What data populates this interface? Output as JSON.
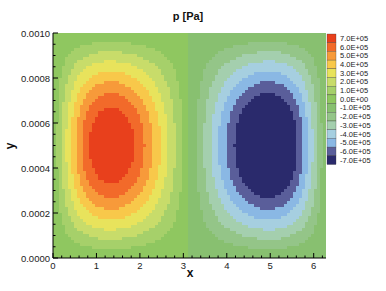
{
  "chart_data": {
    "type": "heatmap",
    "subtype": "filled-contour",
    "title": "p [Pa]",
    "xlabel": "x",
    "ylabel": "y",
    "xlim": [
      0,
      6.2832
    ],
    "ylim": [
      0,
      0.001
    ],
    "xticks": [
      0,
      1,
      2,
      3,
      4,
      5,
      6
    ],
    "xtick_labels": [
      "0",
      "1",
      "2",
      "3",
      "4",
      "5",
      "6"
    ],
    "yticks": [
      0,
      0.0002,
      0.0004,
      0.0006,
      0.0008,
      0.001
    ],
    "ytick_labels": [
      "0.0000",
      "0.0002",
      "0.0004",
      "0.0006",
      "0.0008",
      "0.0010"
    ],
    "grid": false,
    "legend_position": "right",
    "levels": [
      700000.0,
      600000.0,
      500000.0,
      400000.0,
      300000.0,
      200000.0,
      100000.0,
      0.0,
      -100000.0,
      -200000.0,
      -300000.0,
      -400000.0,
      -500000.0,
      -600000.0,
      -700000.0
    ],
    "level_labels": [
      "7.0E+05",
      "6.0E+05",
      "5.0E+05",
      "4.0E+05",
      "3.0E+05",
      "2.0E+05",
      "1.0E+05",
      "0.0E+00",
      "-1.0E+05",
      "-2.0E+05",
      "-3.0E+05",
      "-4.0E+05",
      "-5.0E+05",
      "-6.0E+05",
      "-7.0E+05"
    ],
    "level_colors": [
      "#e8401c",
      "#f26a2a",
      "#f79a3a",
      "#f8c84a",
      "#e8e35c",
      "#c8dc6a",
      "#a6d06a",
      "#8fc760",
      "#88c070",
      "#94c588",
      "#a4cfae",
      "#a6cfe0",
      "#8ab8e4",
      "#5a5e9a",
      "#2a2a6c"
    ],
    "background_color": "#8cc464",
    "features": [
      {
        "name": "positive-pressure-peak",
        "x_center": 1.85,
        "y_center": 0.0005,
        "peak_value": 700000.0
      },
      {
        "name": "negative-pressure-trough",
        "x_center": 4.6,
        "y_center": 0.0005,
        "peak_value": -700000.0
      }
    ]
  }
}
